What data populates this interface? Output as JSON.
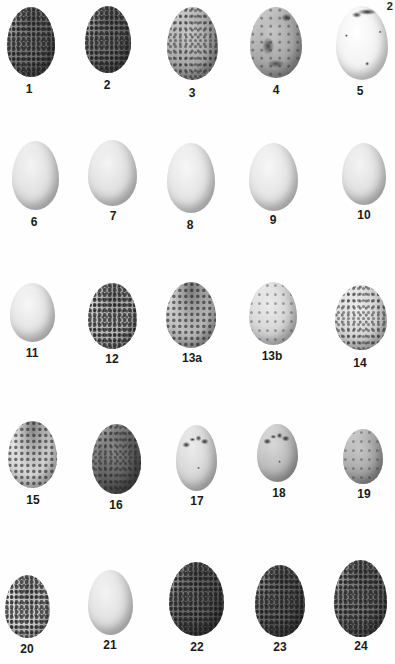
{
  "page": {
    "corner_fragment": "2 ",
    "background": "#fefefe"
  },
  "plate": {
    "rows": [
      [
        "1",
        "2",
        "3",
        "4",
        "5"
      ],
      [
        "6",
        "7",
        "8",
        "9",
        "10"
      ],
      [
        "11",
        "12",
        "13a",
        "13b",
        "14"
      ],
      [
        "15",
        "16",
        "17",
        "18",
        "19"
      ],
      [
        "20",
        "21",
        "22",
        "23",
        "24"
      ]
    ]
  },
  "eggs": [
    {
      "label": "1",
      "tone": "dark",
      "pattern": "heavy"
    },
    {
      "label": "2",
      "tone": "dark",
      "pattern": "heavy"
    },
    {
      "label": "3",
      "tone": "mid",
      "pattern": "fine"
    },
    {
      "label": "4",
      "tone": "mid",
      "pattern": "blot"
    },
    {
      "label": "5",
      "tone": "white",
      "pattern": "scrawl"
    },
    {
      "label": "6",
      "tone": "plain",
      "pattern": "none"
    },
    {
      "label": "7",
      "tone": "plain",
      "pattern": "none"
    },
    {
      "label": "8",
      "tone": "plain2",
      "pattern": "none"
    },
    {
      "label": "9",
      "tone": "plain2",
      "pattern": "none"
    },
    {
      "label": "10",
      "tone": "plain",
      "pattern": "none"
    },
    {
      "label": "11",
      "tone": "plain2",
      "pattern": "none"
    },
    {
      "label": "12",
      "tone": "midl",
      "pattern": "heavy"
    },
    {
      "label": "13a",
      "tone": "midl",
      "pattern": "cap"
    },
    {
      "label": "13b",
      "tone": "light",
      "pattern": "sparse"
    },
    {
      "label": "14",
      "tone": "light",
      "pattern": "fine"
    },
    {
      "label": "15",
      "tone": "light",
      "pattern": "cap"
    },
    {
      "label": "16",
      "tone": "darker",
      "pattern": "fine"
    },
    {
      "label": "17",
      "tone": "light",
      "pattern": "spots"
    },
    {
      "label": "18",
      "tone": "midl",
      "pattern": "spots"
    },
    {
      "label": "19",
      "tone": "mid",
      "pattern": "sparse"
    },
    {
      "label": "20",
      "tone": "light",
      "pattern": "heavy"
    },
    {
      "label": "21",
      "tone": "plain",
      "pattern": "none"
    },
    {
      "label": "22",
      "tone": "darker",
      "pattern": "heavy"
    },
    {
      "label": "23",
      "tone": "darker",
      "pattern": "heavy"
    },
    {
      "label": "24",
      "tone": "dark",
      "pattern": "heavy"
    }
  ]
}
